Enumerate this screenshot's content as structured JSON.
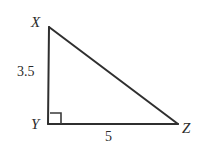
{
  "figure": {
    "type": "right-triangle-diagram",
    "background_color": "#ffffff",
    "stroke_color": "#2f2f2f",
    "stroke_width": 2,
    "vertices": {
      "X": {
        "label": "X",
        "x": 49,
        "y": 27
      },
      "Y": {
        "label": "Y",
        "x": 48,
        "y": 124
      },
      "Z": {
        "label": "Z",
        "x": 178,
        "y": 124
      }
    },
    "sides": {
      "vertical_leg": {
        "label": "3.5",
        "from": "X",
        "to": "Y"
      },
      "horizontal_leg": {
        "label": "5",
        "from": "Y",
        "to": "Z"
      },
      "hypotenuse": {
        "label": "",
        "from": "X",
        "to": "Z"
      }
    },
    "right_angle": {
      "at_vertex": "Y",
      "marker": "square",
      "size": 11
    }
  }
}
